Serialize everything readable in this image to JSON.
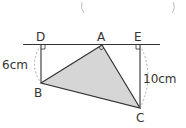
{
  "diagram": {
    "points": {
      "A": {
        "label": "A",
        "x": 102,
        "y": 45
      },
      "B": {
        "label": "B",
        "x": 41,
        "y": 83
      },
      "C": {
        "label": "C",
        "x": 140,
        "y": 108
      },
      "D": {
        "label": "D",
        "x": 41,
        "y": 44
      },
      "E": {
        "label": "E",
        "x": 140,
        "y": 44
      }
    },
    "measurements": {
      "BD": "6cm",
      "CE": "10cm"
    },
    "colors": {
      "triangle_fill": "#d6d6d6",
      "line": "#333333",
      "dashed": "#999999"
    }
  }
}
